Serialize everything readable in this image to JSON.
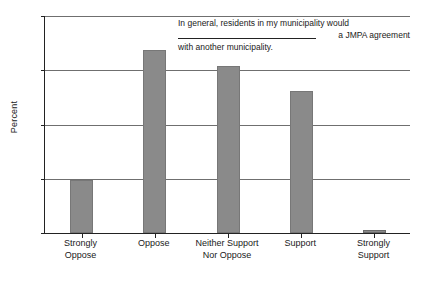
{
  "chart_data": {
    "type": "bar",
    "title_lines": [
      "In general, residents in my municipality would",
      "a JMPA agreement",
      "with another municipality."
    ],
    "categories": [
      "Strongly\nOppose",
      "Oppose",
      "Neither Support\nNor Oppose",
      "Support",
      "Strongly\nSupport"
    ],
    "values": [
      9.8,
      33.8,
      30.7,
      26.2,
      0.5
    ],
    "xlabel": "",
    "ylabel": "Percent",
    "ylim": [
      0,
      40
    ],
    "yticks": [
      0,
      10,
      20,
      30,
      40
    ],
    "ytick_labels": [
      "0",
      "10",
      "20",
      "30",
      "40"
    ],
    "grid": "horizontal",
    "legend": "none",
    "bar_color": "#8a8a8a",
    "axis_color": "#222222",
    "grid_color": "#6f6f6f",
    "background": "#ffffff"
  }
}
